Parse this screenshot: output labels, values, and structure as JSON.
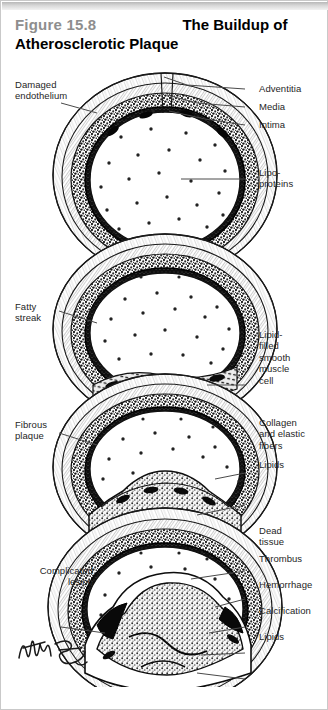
{
  "figure": {
    "number": "Figure 15.8",
    "title": "The Buildup of\nAtherosclerotic Plaque",
    "border_color": "#c9c9c9",
    "number_color": "#8e8e8e",
    "title_color": "#000000"
  },
  "artwork": {
    "description": "Four stacked cross-sections of an artery showing progressive atherosclerotic plaque buildup",
    "ink_color": "#1a1a1a",
    "signature": "illustrator-signature"
  },
  "labels": {
    "damaged_endothelium": "Damaged\nendothelium",
    "adventitia": "Adventitia",
    "media": "Media",
    "intima": "Intima",
    "lipoproteins": "Lipo-\nproteins",
    "fatty_streak": "Fatty\nstreak",
    "lipid_filled_smooth_muscle_cell": "Lipid-\nfilled\nsmooth\nmuscle\ncell",
    "fibrous_plaque": "Fibrous\nplaque",
    "collagen_and_elastic_fibers": "Collagen\nand elastic\nfibers",
    "lipids_panel3": "Lipids",
    "complicated_lesion": "Complicated\nlesion",
    "dead_tissue": "Dead\ntissue",
    "thrombus": "Thrombus",
    "hemorrhage": "Hemorrhage",
    "calcification": "Calcification",
    "lipids_panel4": "Lipids"
  }
}
